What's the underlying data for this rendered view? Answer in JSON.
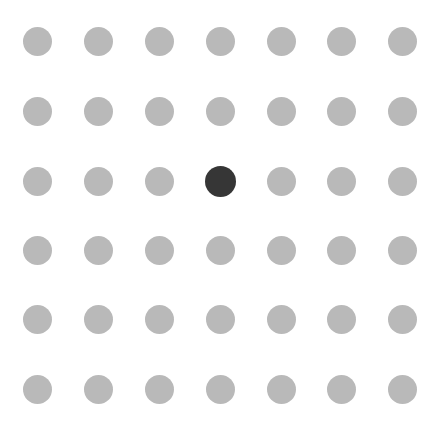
{
  "grid": {
    "rows": 6,
    "cols": 7,
    "col_centers": [
      37,
      98,
      159,
      220,
      281,
      341,
      402
    ],
    "row_centers": [
      41,
      111,
      181,
      250,
      319,
      389
    ],
    "dot_color": "#b9b9b9",
    "active_color": "#363636",
    "active": {
      "row": 2,
      "col": 3
    }
  }
}
